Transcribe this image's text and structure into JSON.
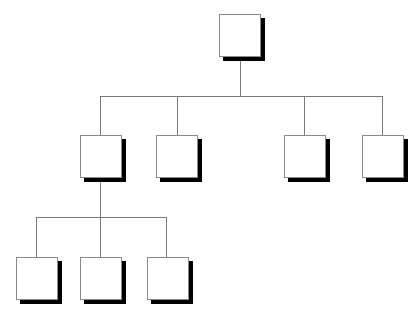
{
  "diagram": {
    "type": "org-chart",
    "colors": {
      "node_fill": "#ffffff",
      "node_border": "#8a8a8a",
      "shadow": "#000000",
      "connector": "#7a7a7a"
    },
    "nodes": [
      {
        "id": "root",
        "label": "",
        "level": 0,
        "x": 219,
        "y": 14
      },
      {
        "id": "l1-1",
        "label": "",
        "level": 1,
        "parent": "root",
        "x": 80,
        "y": 135
      },
      {
        "id": "l1-2",
        "label": "",
        "level": 1,
        "parent": "root",
        "x": 156,
        "y": 135
      },
      {
        "id": "l1-3",
        "label": "",
        "level": 1,
        "parent": "root",
        "x": 284,
        "y": 135
      },
      {
        "id": "l1-4",
        "label": "",
        "level": 1,
        "parent": "root",
        "x": 362,
        "y": 135
      },
      {
        "id": "l2-1",
        "label": "",
        "level": 2,
        "parent": "l1-1",
        "x": 16,
        "y": 257
      },
      {
        "id": "l2-2",
        "label": "",
        "level": 2,
        "parent": "l1-1",
        "x": 80,
        "y": 257
      },
      {
        "id": "l2-3",
        "label": "",
        "level": 2,
        "parent": "l1-1",
        "x": 147,
        "y": 257
      }
    ]
  }
}
